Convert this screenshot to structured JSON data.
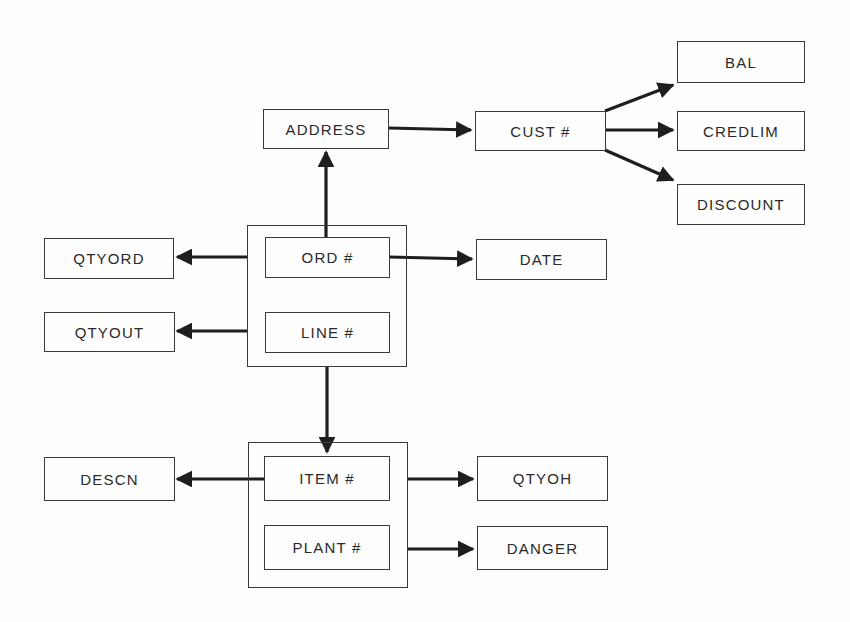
{
  "diagram": {
    "type": "functional-dependency-diagram",
    "groups": [
      {
        "id": "order_line_key",
        "members": [
          "ord_no",
          "line_no"
        ]
      },
      {
        "id": "item_plant_key",
        "members": [
          "item_no",
          "plant_no"
        ]
      }
    ],
    "nodes": {
      "address": {
        "label": "ADDRESS"
      },
      "cust_no": {
        "label": "CUST #"
      },
      "bal": {
        "label": "BAL"
      },
      "credlim": {
        "label": "CREDLIM"
      },
      "discount": {
        "label": "DISCOUNT"
      },
      "qtyord": {
        "label": "QTYORD"
      },
      "qtyout": {
        "label": "QTYOUT"
      },
      "ord_no": {
        "label": "ORD #"
      },
      "line_no": {
        "label": "LINE #"
      },
      "date": {
        "label": "DATE"
      },
      "descn": {
        "label": "DESCN"
      },
      "item_no": {
        "label": "ITEM #"
      },
      "plant_no": {
        "label": "PLANT #"
      },
      "qtyoh": {
        "label": "QTYOH"
      },
      "danger": {
        "label": "DANGER"
      }
    },
    "edges": [
      {
        "from": "order_line_key",
        "to": "address"
      },
      {
        "from": "address",
        "to": "cust_no"
      },
      {
        "from": "cust_no",
        "to": "bal"
      },
      {
        "from": "cust_no",
        "to": "credlim"
      },
      {
        "from": "cust_no",
        "to": "discount"
      },
      {
        "from": "ord_no",
        "to": "date"
      },
      {
        "from": "order_line_key",
        "to": "qtyord"
      },
      {
        "from": "order_line_key",
        "to": "qtyout"
      },
      {
        "from": "order_line_key",
        "to": "item_plant_key"
      },
      {
        "from": "item_no",
        "to": "descn"
      },
      {
        "from": "item_plant_key",
        "to": "qtyoh"
      },
      {
        "from": "item_plant_key",
        "to": "danger"
      }
    ],
    "colors": {
      "line": "#1e1e1e",
      "border": "#3a3a3a",
      "text": "#2a2a2a",
      "background": "#fdfdfc"
    }
  }
}
